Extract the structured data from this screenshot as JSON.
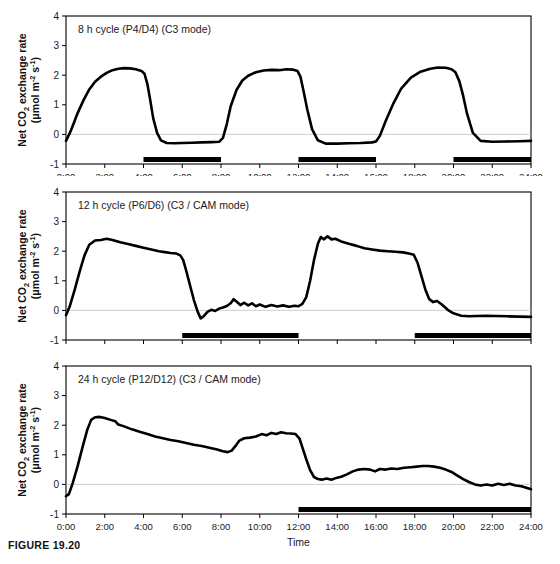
{
  "figure": {
    "caption": "FIGURE 19.20",
    "xlabel": "Time",
    "ylabel_main": "Net CO",
    "ylabel_sub": "2",
    "ylabel_rest": " exchange rate",
    "ylabel_units_open": "(μmol m",
    "ylabel_units_sup1": "-2",
    "ylabel_units_mid": " s",
    "ylabel_units_sup2": "-1",
    "ylabel_units_close": ")"
  },
  "chart_data": [
    {
      "type": "line",
      "title": "8 h cycle (P4/D4) (C3 mode)",
      "xlabel": "Time",
      "ylabel": "Net CO2 exchange rate (μmol m-2 s-1)",
      "xlim": [
        0,
        24
      ],
      "ylim": [
        -1,
        4
      ],
      "xticks": [
        "0:00",
        "2:00",
        "4:00",
        "6:00",
        "8:00",
        "10:00",
        "12:00",
        "14:00",
        "16:00",
        "18:00",
        "20:00",
        "22:00",
        "24:00"
      ],
      "xtick_values": [
        0,
        2,
        4,
        6,
        8,
        10,
        12,
        14,
        16,
        18,
        20,
        22,
        24
      ],
      "yticks": [
        "-1",
        "0",
        "1",
        "2",
        "3",
        "4"
      ],
      "ytick_values": [
        -1,
        0,
        1,
        2,
        3,
        4
      ],
      "grid": false,
      "legend": "none",
      "dark_periods": [
        [
          4,
          8
        ],
        [
          12,
          16
        ],
        [
          20,
          24
        ]
      ],
      "x": [
        0.0,
        0.2,
        0.4,
        0.6,
        0.9,
        1.2,
        1.5,
        1.8,
        2.1,
        2.4,
        2.7,
        3.0,
        3.3,
        3.6,
        3.9,
        4.05,
        4.2,
        4.35,
        4.5,
        4.7,
        4.9,
        5.2,
        5.6,
        6.0,
        6.5,
        7.0,
        7.5,
        7.9,
        8.1,
        8.3,
        8.5,
        8.8,
        9.1,
        9.4,
        9.8,
        10.2,
        10.6,
        11.0,
        11.4,
        11.7,
        11.95,
        12.1,
        12.25,
        12.45,
        12.7,
        13.0,
        13.4,
        14.0,
        14.6,
        15.2,
        15.8,
        16.0,
        16.2,
        16.5,
        16.9,
        17.3,
        17.8,
        18.3,
        18.8,
        19.2,
        19.6,
        19.9,
        20.1,
        20.3,
        20.5,
        20.7,
        21.0,
        21.4,
        22.0,
        22.7,
        23.4,
        24.0
      ],
      "y": [
        -0.22,
        0.05,
        0.38,
        0.72,
        1.15,
        1.52,
        1.78,
        1.95,
        2.08,
        2.17,
        2.22,
        2.24,
        2.23,
        2.2,
        2.14,
        2.05,
        1.7,
        1.15,
        0.55,
        0.05,
        -0.2,
        -0.29,
        -0.3,
        -0.29,
        -0.28,
        -0.27,
        -0.26,
        -0.25,
        -0.12,
        0.35,
        0.95,
        1.5,
        1.82,
        1.98,
        2.1,
        2.16,
        2.18,
        2.17,
        2.2,
        2.19,
        2.14,
        1.95,
        1.5,
        0.85,
        0.18,
        -0.2,
        -0.31,
        -0.31,
        -0.3,
        -0.29,
        -0.27,
        -0.24,
        -0.05,
        0.45,
        1.05,
        1.55,
        1.92,
        2.12,
        2.22,
        2.26,
        2.25,
        2.2,
        2.1,
        1.8,
        1.3,
        0.7,
        0.05,
        -0.22,
        -0.25,
        -0.24,
        -0.23,
        -0.22
      ]
    },
    {
      "type": "line",
      "title": "12 h cycle (P6/D6) (C3 / CAM mode)",
      "xlabel": "Time",
      "ylabel": "Net CO2 exchange rate (μmol m-2 s-1)",
      "xlim": [
        0,
        24
      ],
      "ylim": [
        -1,
        4
      ],
      "xticks": [
        "0:00",
        "2:00",
        "4:00",
        "6:00",
        "8:00",
        "10:00",
        "12:00",
        "14:00",
        "16:00",
        "18:00",
        "20:00",
        "22:00",
        "24:00"
      ],
      "xtick_values": [
        0,
        2,
        4,
        6,
        8,
        10,
        12,
        14,
        16,
        18,
        20,
        22,
        24
      ],
      "yticks": [
        "-1",
        "0",
        "1",
        "2",
        "3",
        "4"
      ],
      "ytick_values": [
        -1,
        0,
        1,
        2,
        3,
        4
      ],
      "grid": false,
      "legend": "none",
      "dark_periods": [
        [
          6,
          12
        ],
        [
          18,
          24
        ]
      ],
      "x": [
        0.0,
        0.2,
        0.45,
        0.7,
        0.95,
        1.2,
        1.5,
        1.8,
        2.1,
        2.4,
        2.8,
        3.2,
        3.6,
        4.0,
        4.4,
        4.8,
        5.1,
        5.4,
        5.7,
        5.9,
        6.05,
        6.2,
        6.4,
        6.6,
        6.8,
        6.95,
        7.1,
        7.3,
        7.5,
        7.7,
        7.9,
        8.1,
        8.3,
        8.5,
        8.65,
        8.8,
        9.0,
        9.2,
        9.4,
        9.6,
        9.8,
        10.0,
        10.3,
        10.6,
        10.9,
        11.2,
        11.5,
        11.8,
        12.0,
        12.2,
        12.4,
        12.6,
        12.8,
        13.0,
        13.15,
        13.3,
        13.5,
        13.7,
        13.9,
        14.2,
        14.6,
        15.0,
        15.4,
        15.8,
        16.2,
        16.6,
        17.0,
        17.4,
        17.7,
        17.95,
        18.15,
        18.35,
        18.55,
        18.75,
        18.95,
        19.15,
        19.4,
        19.7,
        20.0,
        20.4,
        20.8,
        21.2,
        21.7,
        22.2,
        22.8,
        23.4,
        24.0
      ],
      "y": [
        -0.16,
        0.15,
        0.7,
        1.3,
        1.85,
        2.22,
        2.36,
        2.38,
        2.42,
        2.38,
        2.3,
        2.24,
        2.18,
        2.12,
        2.06,
        2.0,
        1.97,
        1.94,
        1.92,
        1.86,
        1.7,
        1.35,
        0.85,
        0.35,
        -0.05,
        -0.27,
        -0.2,
        -0.05,
        0.02,
        -0.02,
        0.06,
        0.1,
        0.15,
        0.24,
        0.38,
        0.3,
        0.18,
        0.26,
        0.17,
        0.24,
        0.14,
        0.2,
        0.12,
        0.18,
        0.13,
        0.17,
        0.12,
        0.16,
        0.14,
        0.22,
        0.45,
        1.0,
        1.7,
        2.25,
        2.48,
        2.4,
        2.5,
        2.4,
        2.42,
        2.33,
        2.25,
        2.18,
        2.1,
        2.06,
        2.02,
        2.0,
        1.98,
        1.96,
        1.92,
        1.88,
        1.6,
        1.15,
        0.7,
        0.38,
        0.28,
        0.32,
        0.2,
        0.02,
        -0.1,
        -0.18,
        -0.2,
        -0.19,
        -0.18,
        -0.19,
        -0.2,
        -0.21,
        -0.22
      ]
    },
    {
      "type": "line",
      "title": "24 h cycle (P12/D12) (C3 / CAM mode)",
      "xlabel": "Time",
      "ylabel": "Net CO2 exchange rate (μmol m-2 s-1)",
      "xlim": [
        0,
        24
      ],
      "ylim": [
        -1,
        4
      ],
      "xticks": [
        "0:00",
        "2:00",
        "4:00",
        "6:00",
        "8:00",
        "10:00",
        "12:00",
        "14:00",
        "16:00",
        "18:00",
        "20:00",
        "22:00",
        "24:00"
      ],
      "xtick_values": [
        0,
        2,
        4,
        6,
        8,
        10,
        12,
        14,
        16,
        18,
        20,
        22,
        24
      ],
      "yticks": [
        "-1",
        "0",
        "1",
        "2",
        "3",
        "4"
      ],
      "ytick_values": [
        -1,
        0,
        1,
        2,
        3,
        4
      ],
      "grid": false,
      "legend": "none",
      "dark_periods": [
        [
          12,
          24
        ]
      ],
      "x": [
        0.0,
        0.15,
        0.35,
        0.6,
        0.85,
        1.1,
        1.3,
        1.5,
        1.75,
        2.0,
        2.3,
        2.55,
        2.7,
        3.0,
        3.4,
        3.8,
        4.2,
        4.6,
        5.0,
        5.4,
        5.8,
        6.2,
        6.6,
        7.0,
        7.4,
        7.8,
        8.1,
        8.35,
        8.55,
        8.75,
        8.95,
        9.2,
        9.5,
        9.8,
        10.1,
        10.35,
        10.6,
        10.85,
        11.1,
        11.35,
        11.6,
        11.85,
        12.05,
        12.2,
        12.4,
        12.6,
        12.8,
        13.0,
        13.2,
        13.45,
        13.7,
        13.95,
        14.2,
        14.5,
        14.8,
        15.1,
        15.4,
        15.7,
        15.95,
        16.2,
        16.5,
        16.8,
        17.1,
        17.45,
        17.8,
        18.1,
        18.4,
        18.7,
        19.0,
        19.3,
        19.6,
        19.9,
        20.2,
        20.5,
        20.8,
        21.1,
        21.4,
        21.7,
        22.0,
        22.3,
        22.6,
        22.9,
        23.2,
        23.5,
        23.8,
        24.0
      ],
      "y": [
        -0.4,
        -0.33,
        0.05,
        0.62,
        1.25,
        1.85,
        2.18,
        2.27,
        2.28,
        2.24,
        2.18,
        2.13,
        2.02,
        1.96,
        1.86,
        1.78,
        1.7,
        1.62,
        1.56,
        1.5,
        1.46,
        1.4,
        1.34,
        1.3,
        1.24,
        1.18,
        1.12,
        1.09,
        1.14,
        1.3,
        1.48,
        1.56,
        1.58,
        1.62,
        1.7,
        1.66,
        1.74,
        1.7,
        1.76,
        1.73,
        1.72,
        1.7,
        1.55,
        1.25,
        0.85,
        0.48,
        0.25,
        0.18,
        0.16,
        0.2,
        0.16,
        0.22,
        0.26,
        0.34,
        0.44,
        0.5,
        0.52,
        0.5,
        0.44,
        0.52,
        0.5,
        0.54,
        0.52,
        0.56,
        0.58,
        0.6,
        0.62,
        0.62,
        0.6,
        0.56,
        0.5,
        0.42,
        0.3,
        0.18,
        0.08,
        0.0,
        -0.04,
        0.0,
        -0.04,
        0.02,
        -0.02,
        0.02,
        -0.04,
        -0.06,
        -0.12,
        -0.16
      ]
    }
  ]
}
